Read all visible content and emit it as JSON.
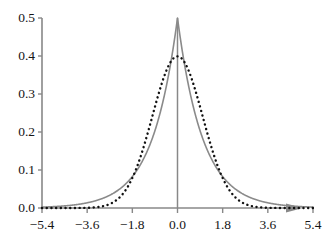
{
  "chart_data": {
    "type": "line",
    "title": "",
    "subtitle": "",
    "xlabel": "",
    "ylabel": "",
    "xlim": [
      -5.4,
      5.4
    ],
    "ylim": [
      0.0,
      0.5
    ],
    "grid": false,
    "legend": "none",
    "x_ticks": [
      -5.4,
      -3.6,
      -1.8,
      0.0,
      1.8,
      3.6,
      5.4
    ],
    "x_tick_labels": [
      "−5.4",
      "−3.6",
      "−1.8",
      "0.0",
      "1.8",
      "3.6",
      "5.4"
    ],
    "y_ticks": [
      0.0,
      0.1,
      0.2,
      0.3,
      0.4,
      0.5
    ],
    "y_tick_labels": [
      "0.0",
      "0.1",
      "0.2",
      "0.3",
      "0.4",
      "0.5"
    ],
    "axis_color": "#888888",
    "x_axis_has_arrow": true,
    "vertical_center_line": true,
    "series": [
      {
        "name": "Laplace density (b = 1)",
        "style": "solid",
        "color": "#8a8a8a",
        "width": 1.6,
        "peak_x": 0.0,
        "peak_y": 0.5,
        "formula": "0.5*exp(-abs(x))",
        "x": [
          -5.4,
          -5.0,
          -4.6,
          -4.2,
          -3.8,
          -3.4,
          -3.0,
          -2.6,
          -2.2,
          -1.8,
          -1.4,
          -1.0,
          -0.6,
          -0.3,
          0.0,
          0.3,
          0.6,
          1.0,
          1.4,
          1.8,
          2.2,
          2.6,
          3.0,
          3.4,
          3.8,
          4.2,
          4.6,
          5.0,
          5.4
        ],
        "values": [
          0.0023,
          0.0034,
          0.005,
          0.0075,
          0.0112,
          0.0167,
          0.0249,
          0.0372,
          0.0554,
          0.0826,
          0.1233,
          0.1839,
          0.2744,
          0.3704,
          0.5,
          0.3704,
          0.2744,
          0.1839,
          0.1233,
          0.0826,
          0.0554,
          0.0372,
          0.0249,
          0.0167,
          0.0112,
          0.0075,
          0.005,
          0.0034,
          0.0023
        ]
      },
      {
        "name": "Normal density (σ = 1)",
        "style": "dotted",
        "color": "#101010",
        "width": 2.4,
        "peak_x": 0.0,
        "peak_y": 0.3989,
        "formula": "exp(-x^2/2)/sqrt(2*pi)",
        "x": [
          -5.4,
          -5.0,
          -4.6,
          -4.2,
          -3.8,
          -3.4,
          -3.0,
          -2.6,
          -2.2,
          -1.8,
          -1.4,
          -1.0,
          -0.6,
          -0.3,
          0.0,
          0.3,
          0.6,
          1.0,
          1.4,
          1.8,
          2.2,
          2.6,
          3.0,
          3.4,
          3.8,
          4.2,
          4.6,
          5.0,
          5.4
        ],
        "values": [
          0.0,
          0.0,
          0.0,
          0.0001,
          0.0003,
          0.0012,
          0.0044,
          0.0136,
          0.0355,
          0.079,
          0.1497,
          0.242,
          0.3332,
          0.3814,
          0.3989,
          0.3814,
          0.3332,
          0.242,
          0.1497,
          0.079,
          0.0355,
          0.0136,
          0.0044,
          0.0012,
          0.0003,
          0.0001,
          0.0,
          0.0,
          0.0
        ]
      }
    ]
  }
}
